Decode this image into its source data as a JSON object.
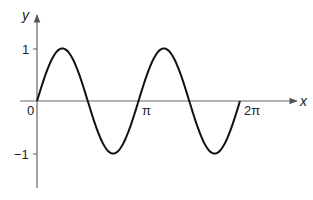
{
  "chart_data": {
    "type": "line",
    "title": "",
    "function": "y = sin(2x)",
    "xlabel": "x",
    "ylabel": "y",
    "xlim": [
      0,
      6.2832
    ],
    "ylim": [
      -1.6,
      1.3
    ],
    "grid": false,
    "legend": null,
    "x_ticks": [
      {
        "value": 0,
        "label": "0"
      },
      {
        "value": 3.1416,
        "label": "π"
      },
      {
        "value": 6.2832,
        "label": "2π"
      }
    ],
    "y_ticks": [
      {
        "value": 1,
        "label": "1"
      },
      {
        "value": -1,
        "label": "−1"
      }
    ],
    "series": [
      {
        "name": "sin(2x)",
        "color": "#111111",
        "x": [
          0,
          0.7854,
          1.5708,
          2.3562,
          3.1416,
          3.927,
          4.7124,
          5.4978,
          6.2832
        ],
        "y": [
          0,
          1,
          0,
          -1,
          0,
          1,
          0,
          -1,
          0
        ]
      }
    ]
  },
  "labels": {
    "x_axis": "x",
    "y_axis": "y",
    "origin": "0",
    "pi": "π",
    "two_pi": "2π",
    "one": "1",
    "minus_one": "−1"
  },
  "colors": {
    "curve": "#111111",
    "axis": "#555555",
    "text": "#222222"
  }
}
